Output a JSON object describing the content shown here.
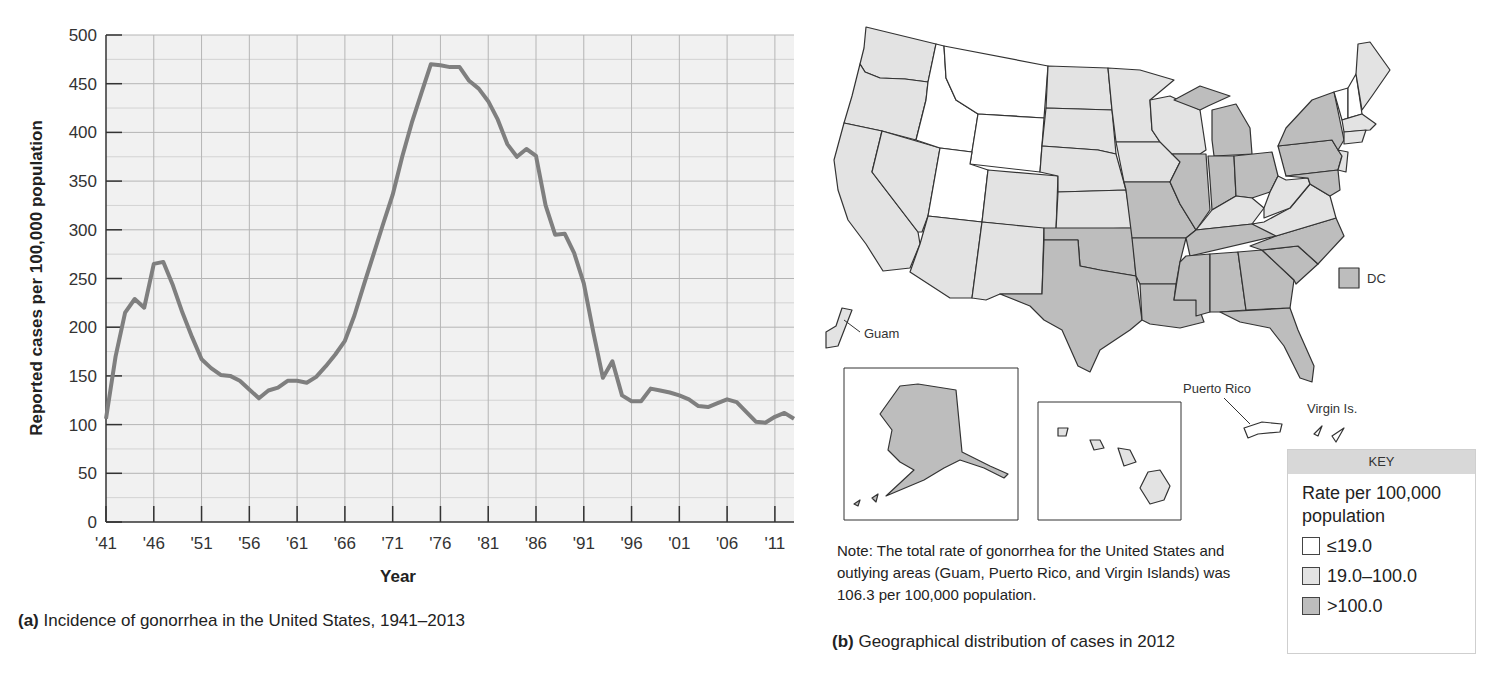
{
  "chart_data": [
    {
      "type": "line",
      "title": "Incidence of gonorrhea in the United States, 1941–2013",
      "panel_label": "(a)",
      "xlabel": "Year",
      "ylabel": "Reported cases per 100,000 population",
      "ylim": [
        0,
        500
      ],
      "xlim": [
        1941,
        2013
      ],
      "grid": true,
      "legend": null,
      "x_tick_labels": [
        "'41",
        "'46",
        "'51",
        "'56",
        "'61",
        "'66",
        "'71",
        "'76",
        "'81",
        "'86",
        "'91",
        "'96",
        "'01",
        "'06",
        "'11"
      ],
      "x_tick_values": [
        1941,
        1946,
        1951,
        1956,
        1961,
        1966,
        1971,
        1976,
        1981,
        1986,
        1991,
        1996,
        2001,
        2006,
        2011
      ],
      "y_tick_labels": [
        "0",
        "50",
        "100",
        "150",
        "200",
        "250",
        "300",
        "350",
        "400",
        "450",
        "500"
      ],
      "y_tick_values": [
        0,
        50,
        100,
        150,
        200,
        250,
        300,
        350,
        400,
        450,
        500
      ],
      "x": [
        1941,
        1942,
        1943,
        1944,
        1945,
        1946,
        1947,
        1948,
        1949,
        1950,
        1951,
        1952,
        1953,
        1954,
        1955,
        1956,
        1957,
        1958,
        1959,
        1960,
        1961,
        1962,
        1963,
        1964,
        1965,
        1966,
        1967,
        1968,
        1969,
        1970,
        1971,
        1972,
        1973,
        1974,
        1975,
        1976,
        1977,
        1978,
        1979,
        1980,
        1981,
        1982,
        1983,
        1984,
        1985,
        1986,
        1987,
        1988,
        1989,
        1990,
        1991,
        1992,
        1993,
        1994,
        1995,
        1996,
        1997,
        1998,
        1999,
        2000,
        2001,
        2002,
        2003,
        2004,
        2005,
        2006,
        2007,
        2008,
        2009,
        2010,
        2011,
        2012,
        2013
      ],
      "series": [
        {
          "name": "Reported cases per 100,000 population",
          "color": "#7f7f7f",
          "values": [
            106,
            170,
            215,
            229,
            220,
            265,
            267,
            243,
            215,
            190,
            167,
            158,
            151,
            150,
            145,
            136,
            127,
            135,
            138,
            145,
            145,
            143,
            149,
            160,
            172,
            186,
            212,
            244,
            275,
            306,
            336,
            375,
            410,
            440,
            470,
            469,
            467,
            467,
            453,
            445,
            432,
            413,
            388,
            375,
            383,
            376,
            325,
            295,
            296,
            276,
            245,
            195,
            148,
            165,
            130,
            124,
            124,
            137,
            135,
            133,
            130,
            126,
            119,
            118,
            122,
            126,
            123,
            113,
            103,
            102,
            108,
            112,
            106
          ]
        }
      ]
    },
    {
      "type": "map",
      "title": "Geographical distribution of cases in 2012",
      "panel_label": "(b)",
      "legend": {
        "header": "KEY",
        "title": "Rate per 100,000 population",
        "entries": [
          {
            "label": "≤19.0",
            "color": "#ffffff"
          },
          {
            "label": "19.0–100.0",
            "color": "#e3e3e3"
          },
          {
            "label": ">100.0",
            "color": "#bdbdbd"
          }
        ]
      },
      "categories": {
        "le_19": [
          "Montana",
          "Idaho",
          "Wyoming",
          "Utah",
          "Vermont",
          "New Hampshire"
        ],
        "19_to_100": [
          "Washington",
          "Oregon",
          "California",
          "Nevada",
          "Arizona",
          "Colorado",
          "New Mexico",
          "North Dakota",
          "South Dakota",
          "Nebraska",
          "Kansas",
          "Minnesota",
          "Iowa",
          "Wisconsin",
          "Kentucky",
          "West Virginia",
          "Virginia",
          "Maine",
          "Massachusetts",
          "Connecticut",
          "Rhode Island",
          "New Jersey",
          "Hawaii",
          "Guam",
          "Puerto Rico",
          "Virgin Islands"
        ],
        "gt_100": [
          "Texas",
          "Oklahoma",
          "Missouri",
          "Arkansas",
          "Louisiana",
          "Illinois",
          "Indiana",
          "Michigan",
          "Ohio",
          "Pennsylvania",
          "New York",
          "Tennessee",
          "Mississippi",
          "Alabama",
          "Georgia",
          "Florida",
          "South Carolina",
          "North Carolina",
          "Maryland",
          "Delaware",
          "Alaska",
          "DC"
        ]
      },
      "annotations": [
        "Guam",
        "DC",
        "Puerto Rico",
        "Virgin Is."
      ],
      "note": "Note: The total rate of gonorrhea for the United States and outlying areas (Guam, Puerto Rico, and Virgin Islands) was 106.3 per 100,000 population."
    }
  ],
  "panel_a": {
    "label": "(a)",
    "caption": " Incidence of gonorrhea in the United States, 1941–2013",
    "ylabel": "Reported cases per 100,000 population",
    "xlabel": "Year"
  },
  "panel_b": {
    "label": "(b)",
    "caption": " Geographical distribution of cases in 2012",
    "note": "Note: The total rate of gonorrhea for the United States and outlying areas (Guam, Puerto Rico, and Virgin Islands) was 106.3 per 100,000 population.",
    "labels": {
      "guam": "Guam",
      "dc": "DC",
      "puerto_rico": "Puerto Rico",
      "virgin_islands": "Virgin Is."
    },
    "key": {
      "header": "KEY",
      "title": "Rate per 100,000 population",
      "items": [
        {
          "label": "≤19.0",
          "color": "#ffffff"
        },
        {
          "label": "19.0–100.0",
          "color": "#e3e3e3"
        },
        {
          "label": ">100.0",
          "color": "#bdbdbd"
        }
      ]
    }
  },
  "colors": {
    "plot_bg": "#f1f1f1",
    "grid": "#b9b9b9",
    "line": "#7f7f7f",
    "low": "#ffffff",
    "mid": "#e3e3e3",
    "high": "#bdbdbd",
    "border": "#333333"
  }
}
